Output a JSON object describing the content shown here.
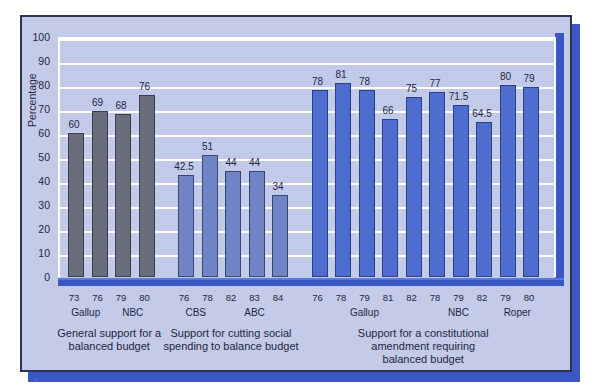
{
  "chart_data": {
    "type": "bar",
    "title": "",
    "xlabel": "",
    "ylabel": "Percentage",
    "ylim": [
      0,
      100
    ],
    "ytick_step": 10,
    "yticks": [
      100,
      90,
      80,
      70,
      60,
      50,
      40,
      30,
      20,
      10,
      0
    ],
    "grid": true,
    "legend": "none",
    "categories": [
      "73",
      "76",
      "79",
      "80",
      "76",
      "78",
      "82",
      "83",
      "84",
      "76",
      "78",
      "79",
      "81",
      "82",
      "78",
      "79",
      "82",
      "79",
      "80"
    ],
    "values": [
      60,
      69,
      68,
      76,
      42.5,
      51,
      44,
      44,
      34,
      78,
      81,
      78,
      66,
      75,
      77,
      71.5,
      64.5,
      80,
      79
    ],
    "bars": [
      {
        "year": "73",
        "value": 60,
        "label": "60",
        "group": 1
      },
      {
        "year": "76",
        "value": 69,
        "label": "69",
        "group": 1
      },
      {
        "year": "79",
        "value": 68,
        "label": "68",
        "group": 1
      },
      {
        "year": "80",
        "value": 76,
        "label": "76",
        "group": 1
      },
      {
        "year": "76",
        "value": 42.5,
        "label": "42.5",
        "group": 2
      },
      {
        "year": "78",
        "value": 51,
        "label": "51",
        "group": 2
      },
      {
        "year": "82",
        "value": 44,
        "label": "44",
        "group": 2
      },
      {
        "year": "83",
        "value": 44,
        "label": "44",
        "group": 2
      },
      {
        "year": "84",
        "value": 34,
        "label": "34",
        "group": 2
      },
      {
        "year": "76",
        "value": 78,
        "label": "78",
        "group": 3
      },
      {
        "year": "78",
        "value": 81,
        "label": "81",
        "group": 3
      },
      {
        "year": "79",
        "value": 78,
        "label": "78",
        "group": 3
      },
      {
        "year": "81",
        "value": 66,
        "label": "66",
        "group": 3
      },
      {
        "year": "82",
        "value": 75,
        "label": "75",
        "group": 3
      },
      {
        "year": "78",
        "value": 77,
        "label": "77",
        "group": 3
      },
      {
        "year": "79",
        "value": 71.5,
        "label": "71.5",
        "group": 3
      },
      {
        "year": "82",
        "value": 64.5,
        "label": "64.5",
        "group": 3
      },
      {
        "year": "79",
        "value": 80,
        "label": "80",
        "group": 3
      },
      {
        "year": "80",
        "value": 79,
        "label": "79",
        "group": 3
      }
    ],
    "pollsters": [
      {
        "name": "Gallup",
        "bars": [
          0,
          1
        ]
      },
      {
        "name": "NBC",
        "bars": [
          2,
          3
        ]
      },
      {
        "name": "CBS",
        "bars": [
          4,
          5
        ]
      },
      {
        "name": "ABC",
        "bars": [
          6,
          7,
          8
        ]
      },
      {
        "name": "Gallup",
        "bars": [
          9,
          10,
          11,
          12,
          13
        ]
      },
      {
        "name": "NBC",
        "bars": [
          14,
          15,
          16
        ]
      },
      {
        "name": "Roper",
        "bars": [
          17,
          18
        ]
      }
    ],
    "groups": [
      {
        "caption": "General support for a\nbalanced budget",
        "line1": "General support for a",
        "line2": "balanced budget",
        "line3": "",
        "bars": [
          0,
          1,
          2,
          3
        ],
        "color": "#696d7c"
      },
      {
        "caption": "Support for cutting social\nspending to balance budget",
        "line1": "Support for cutting social",
        "line2": "spending to balance budget",
        "line3": "",
        "bars": [
          4,
          5,
          6,
          7,
          8
        ],
        "color": "#7083c4"
      },
      {
        "caption": "Support for a constitutional\namendment requiring\nbalanced budget",
        "line1": "Support for a constitutional",
        "line2": "amendment requiring",
        "line3": "balanced budget",
        "bars": [
          9,
          10,
          11,
          12,
          13,
          14,
          15,
          16,
          17,
          18
        ],
        "color": "#4f6cd0"
      }
    ],
    "colors": {
      "group1_bar": "#696d7c",
      "group2_bar": "#7083c4",
      "group3_bar": "#4f6cd0",
      "plot_background": "#c2caea",
      "card_background": "#c3cbe8",
      "axis_blue": "#3a57c4",
      "gridline": "#ffffff",
      "frame_border": "#2c3550",
      "text": "#1f2740"
    }
  }
}
